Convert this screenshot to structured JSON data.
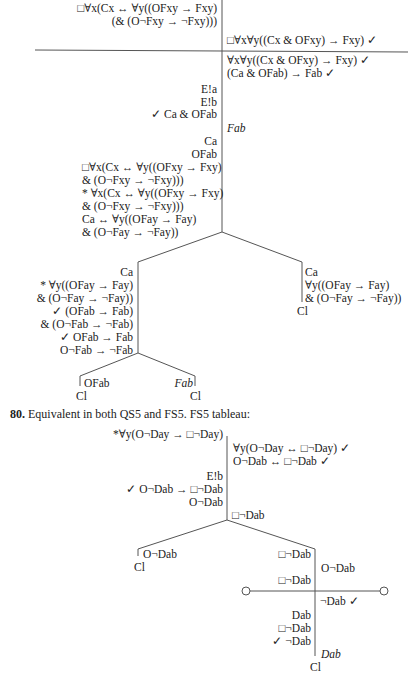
{
  "tableau1": {
    "top_left": [
      "□∀x(Cx ↔ ∀y((OFxy → Fxy)",
      "(& (O¬Fxy → ¬Fxy)))"
    ],
    "top_right": "□∀x∀y((Cx & OFxy) → Fxy)  ✓",
    "right1": [
      "∀x∀y((Cx & OFxy) → Fxy)  ✓",
      "(Ca & OFab) → Fab  ✓"
    ],
    "left1": [
      "E!a",
      "E!b",
      "✓  Ca & OFab"
    ],
    "right2": "Fab",
    "left2": [
      "Ca",
      "OFab",
      "□∀x(Cx ↔ ∀y((OFxy → Fxy)",
      "& (O¬Fxy → ¬Fxy)))",
      "* ∀x(Cx ↔ ∀y((OFxy → Fxy)",
      "& (O¬Fxy → ¬Fxy)))",
      "Ca ↔ ∀y((OFay → Fay)",
      "& (O¬Fay → ¬Fay))"
    ],
    "branch_left": [
      "Ca",
      "* ∀y((OFay → Fay)",
      "& (O¬Fay → ¬Fay))",
      "✓   (OFab → Fab)",
      "& (O¬Fab → ¬Fab)",
      "✓  OFab → Fab",
      "O¬Fab → ¬Fab"
    ],
    "branch_right": [
      "Ca",
      "∀y((OFay → Fay)",
      "& (O¬Fay → ¬Fay))"
    ],
    "branch_right_close": "Cl",
    "leaf_left": "OFab",
    "leaf_left_close": "Cl",
    "leaf_right": "Fab",
    "leaf_right_close": "Cl"
  },
  "item80": {
    "number": "80.",
    "text": "Equivalent in both QS5 and FS5. FS5 tableau:"
  },
  "tableau2": {
    "top_left": "*∀y(O¬Day → □¬Day)",
    "top_right": [
      "∀y(O¬Day ↔ □¬Day)  ✓",
      "O¬Dab ↔ □¬Dab  ✓"
    ],
    "left1": [
      "E!b",
      "✓  O¬Dab → □¬Dab",
      "O¬Dab"
    ],
    "right1": "□¬Dab",
    "leaf_left": "O¬Dab",
    "leaf_left_close": "Cl",
    "mid_left": [
      "□¬Dab",
      "□¬Dab"
    ],
    "mid_right": "O¬Dab",
    "after_line_right": "¬Dab  ✓",
    "after_line_left": [
      "Dab",
      "□¬Dab",
      "✓  ¬Dab"
    ],
    "final_right": "Dab",
    "final_close": "Cl"
  }
}
